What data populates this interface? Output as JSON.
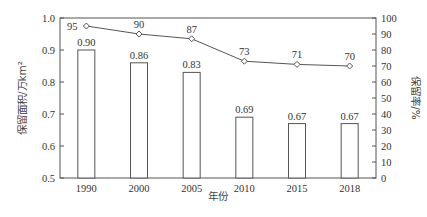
{
  "chart_data": {
    "type": "bar+line",
    "title": "",
    "xlabel": "年份",
    "ylabel_left": "保留面积/万km²",
    "ylabel_right": "保留率/%",
    "categories": [
      "1990",
      "2000",
      "2005",
      "2010",
      "2015",
      "2018"
    ],
    "series": [
      {
        "name": "保留面积",
        "type": "bar",
        "axis": "left",
        "values": [
          0.9,
          0.86,
          0.83,
          0.69,
          0.67,
          0.67
        ],
        "labels": [
          "0.90",
          "0.86",
          "0.83",
          "0.69",
          "0.67",
          "0.67"
        ]
      },
      {
        "name": "保留率",
        "type": "line",
        "axis": "right",
        "marker": "diamond",
        "values": [
          95,
          90,
          87,
          73,
          71,
          70
        ],
        "labels": [
          "95",
          "90",
          "87",
          "73",
          "71",
          "70"
        ]
      }
    ],
    "ylim_left": [
      0.5,
      1.0
    ],
    "yticks_left": [
      "0.5",
      "0.6",
      "0.7",
      "0.8",
      "0.9",
      "1.0"
    ],
    "ylim_right": [
      0,
      100
    ],
    "yticks_right": [
      "0",
      "10",
      "20",
      "30",
      "40",
      "50",
      "60",
      "70",
      "80",
      "90",
      "100"
    ],
    "grid": false,
    "legend": "none"
  },
  "colors": {
    "axis": "#555555",
    "bar_fill": "#ffffff",
    "bar_stroke": "#555555",
    "line": "#555555"
  }
}
